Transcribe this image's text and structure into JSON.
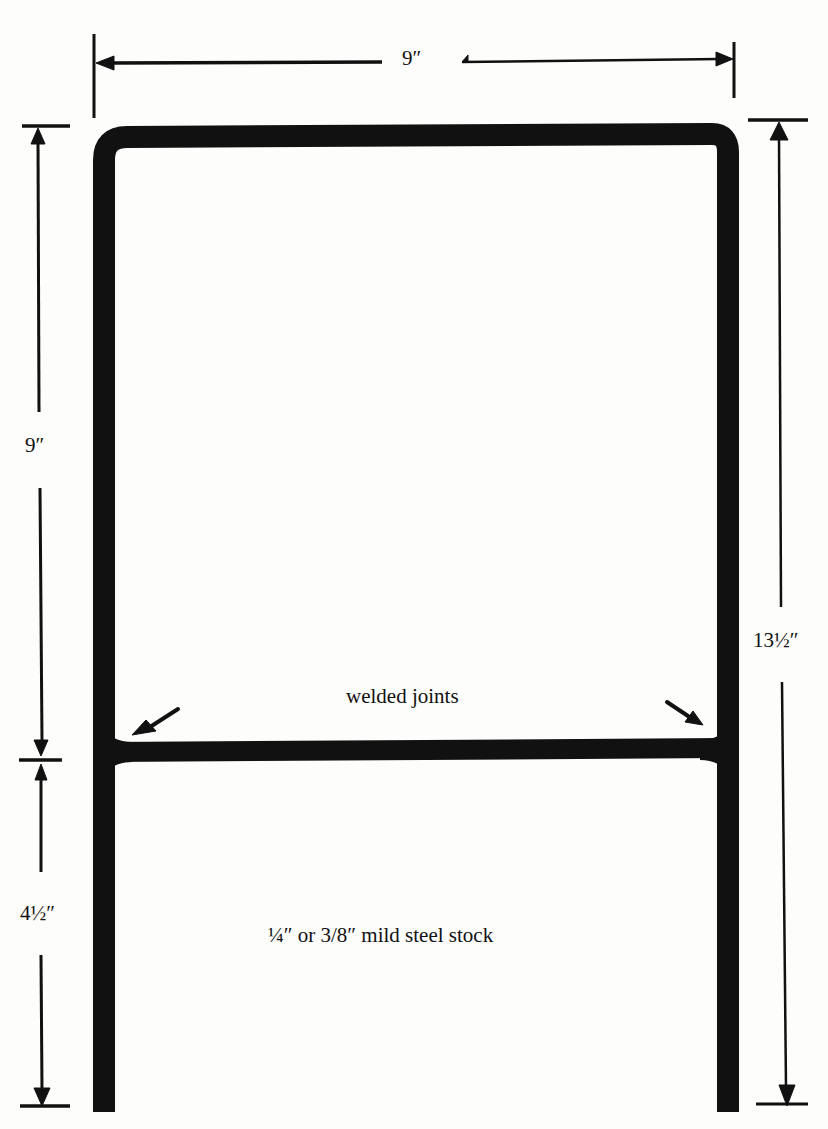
{
  "diagram": {
    "type": "technical-drawing",
    "colors": {
      "ink": "#111111",
      "paper": "#fdfdfb"
    },
    "dimensions": {
      "top_width": "9″",
      "upper_left_height": "9″",
      "lower_left_height": "4½″",
      "right_total_height": "13½″"
    },
    "annotations": {
      "welds": "welded joints",
      "material": "¼″ or 3/8″ mild steel stock"
    }
  }
}
